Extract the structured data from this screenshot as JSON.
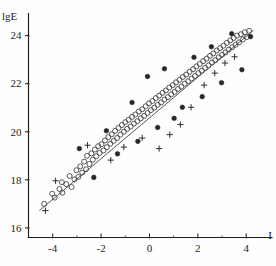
{
  "figure": {
    "kind": "scatter-plot",
    "background_color": "#fefefe",
    "ink_color": "#1d1d1d"
  },
  "chart_data": {
    "type": "scatter",
    "title": "",
    "subtitle": "",
    "xlabel": "I",
    "ylabel": "lgE",
    "xlim": [
      -5.0,
      4.9
    ],
    "ylim": [
      15.6,
      24.9
    ],
    "grid": false,
    "legend": null,
    "legend_position": "none",
    "x_ticks": [
      -4,
      -2,
      0,
      2,
      4
    ],
    "x_tick_labels": [
      "-4",
      "-2",
      "0",
      "2",
      "4"
    ],
    "x_minor_ticks": [
      -3,
      -1,
      1,
      3
    ],
    "y_ticks": [
      16,
      18,
      20,
      22,
      24
    ],
    "y_tick_labels": [
      "16",
      "18",
      "20",
      "22",
      "24"
    ],
    "y_minor_ticks": [],
    "annotations": [],
    "trend_line": {
      "name": "regression line",
      "style": "solid",
      "color": "#3a3a3a",
      "x_start": -4.55,
      "y_start": 16.72,
      "x_end": 4.3,
      "y_end": 24.22
    },
    "series": [
      {
        "name": "open circles",
        "marker": "open-circle",
        "color": "#3c3c3c",
        "fill": "none",
        "points": [
          [
            -4.35,
            17.0
          ],
          [
            -4.02,
            17.42
          ],
          [
            -3.92,
            17.26
          ],
          [
            -3.72,
            17.62
          ],
          [
            -3.62,
            17.9
          ],
          [
            -3.6,
            17.46
          ],
          [
            -3.44,
            17.82
          ],
          [
            -3.3,
            18.16
          ],
          [
            -3.22,
            17.7
          ],
          [
            -3.1,
            18.02
          ],
          [
            -3.02,
            18.4
          ],
          [
            -2.94,
            18.12
          ],
          [
            -2.86,
            18.56
          ],
          [
            -2.78,
            18.3
          ],
          [
            -2.7,
            18.76
          ],
          [
            -2.62,
            18.44
          ],
          [
            -2.58,
            19.0
          ],
          [
            -2.48,
            18.66
          ],
          [
            -2.4,
            19.1
          ],
          [
            -2.34,
            18.84
          ],
          [
            -2.26,
            19.26
          ],
          [
            -2.2,
            18.98
          ],
          [
            -2.12,
            19.4
          ],
          [
            -2.06,
            19.12
          ],
          [
            -1.98,
            19.48
          ],
          [
            -1.9,
            19.22
          ],
          [
            -1.84,
            19.64
          ],
          [
            -1.76,
            19.36
          ],
          [
            -1.7,
            19.78
          ],
          [
            -1.62,
            19.5
          ],
          [
            -1.56,
            19.9
          ],
          [
            -1.48,
            19.62
          ],
          [
            -1.42,
            20.04
          ],
          [
            -1.34,
            19.74
          ],
          [
            -1.28,
            20.16
          ],
          [
            -1.2,
            19.88
          ],
          [
            -1.14,
            20.28
          ],
          [
            -1.06,
            20.0
          ],
          [
            -1.0,
            20.4
          ],
          [
            -0.92,
            20.12
          ],
          [
            -0.86,
            20.5
          ],
          [
            -0.78,
            20.22
          ],
          [
            -0.72,
            20.62
          ],
          [
            -0.64,
            20.34
          ],
          [
            -0.58,
            20.72
          ],
          [
            -0.5,
            20.44
          ],
          [
            -0.44,
            20.84
          ],
          [
            -0.36,
            20.56
          ],
          [
            -0.3,
            20.94
          ],
          [
            -0.22,
            20.66
          ],
          [
            -0.16,
            21.06
          ],
          [
            -0.08,
            20.78
          ],
          [
            -0.02,
            21.18
          ],
          [
            0.06,
            20.9
          ],
          [
            0.12,
            21.28
          ],
          [
            0.2,
            21.0
          ],
          [
            0.26,
            21.4
          ],
          [
            0.34,
            21.12
          ],
          [
            0.4,
            21.5
          ],
          [
            0.48,
            21.22
          ],
          [
            0.54,
            21.62
          ],
          [
            0.62,
            21.34
          ],
          [
            0.68,
            21.72
          ],
          [
            0.76,
            21.44
          ],
          [
            0.82,
            21.84
          ],
          [
            0.9,
            21.56
          ],
          [
            0.96,
            21.94
          ],
          [
            1.04,
            21.66
          ],
          [
            1.1,
            22.06
          ],
          [
            1.18,
            21.78
          ],
          [
            1.24,
            22.16
          ],
          [
            1.32,
            21.88
          ],
          [
            1.38,
            22.28
          ],
          [
            1.46,
            22.0
          ],
          [
            1.52,
            22.38
          ],
          [
            1.6,
            22.1
          ],
          [
            1.66,
            22.5
          ],
          [
            1.74,
            22.22
          ],
          [
            1.8,
            22.6
          ],
          [
            1.88,
            22.32
          ],
          [
            1.94,
            22.72
          ],
          [
            2.02,
            22.44
          ],
          [
            2.08,
            22.82
          ],
          [
            2.16,
            22.54
          ],
          [
            2.22,
            22.94
          ],
          [
            2.3,
            22.66
          ],
          [
            2.36,
            23.04
          ],
          [
            2.44,
            22.76
          ],
          [
            2.5,
            23.16
          ],
          [
            2.58,
            22.88
          ],
          [
            2.64,
            23.26
          ],
          [
            2.72,
            22.98
          ],
          [
            2.78,
            23.38
          ],
          [
            2.86,
            23.1
          ],
          [
            2.92,
            23.48
          ],
          [
            3.0,
            23.2
          ],
          [
            3.06,
            23.58
          ],
          [
            3.14,
            23.3
          ],
          [
            3.2,
            23.7
          ],
          [
            3.28,
            23.42
          ],
          [
            3.34,
            23.8
          ],
          [
            3.42,
            23.52
          ],
          [
            3.48,
            23.9
          ],
          [
            3.56,
            23.62
          ],
          [
            3.62,
            24.0
          ],
          [
            3.7,
            23.72
          ],
          [
            3.78,
            24.06
          ],
          [
            3.86,
            23.84
          ],
          [
            3.94,
            24.14
          ],
          [
            4.02,
            23.94
          ],
          [
            4.12,
            24.2
          ]
        ]
      },
      {
        "name": "filled circles",
        "marker": "filled-circle",
        "color": "#262626",
        "fill": "solid",
        "points": [
          [
            -2.9,
            19.3
          ],
          [
            -2.3,
            18.1
          ],
          [
            -1.78,
            20.04
          ],
          [
            -1.32,
            19.08
          ],
          [
            -0.72,
            21.22
          ],
          [
            -0.48,
            19.6
          ],
          [
            -0.08,
            22.3
          ],
          [
            0.34,
            20.18
          ],
          [
            0.62,
            22.62
          ],
          [
            1.02,
            20.56
          ],
          [
            1.36,
            21.02
          ],
          [
            1.84,
            23.1
          ],
          [
            2.18,
            21.46
          ],
          [
            2.56,
            23.54
          ],
          [
            2.98,
            22.04
          ],
          [
            3.4,
            24.08
          ],
          [
            3.82,
            22.58
          ],
          [
            4.18,
            23.96
          ]
        ]
      },
      {
        "name": "plus markers",
        "marker": "plus",
        "color": "#2e2e2e",
        "fill": "none",
        "points": [
          [
            -4.3,
            16.72
          ],
          [
            -3.88,
            17.96
          ],
          [
            -2.56,
            19.44
          ],
          [
            -1.6,
            18.82
          ],
          [
            -1.06,
            19.36
          ],
          [
            -0.3,
            19.74
          ],
          [
            0.4,
            19.3
          ],
          [
            0.84,
            19.88
          ],
          [
            1.28,
            20.3
          ],
          [
            1.72,
            21.02
          ],
          [
            2.26,
            21.94
          ],
          [
            2.7,
            22.44
          ],
          [
            3.12,
            22.86
          ],
          [
            3.52,
            23.12
          ]
        ]
      }
    ]
  }
}
